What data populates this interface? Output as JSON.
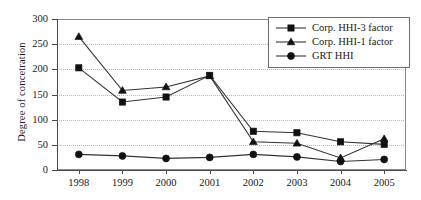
{
  "chart_data": {
    "type": "line",
    "title": "",
    "xlabel": "",
    "ylabel": "Degree of concetration",
    "categories": [
      "1998",
      "1999",
      "2000",
      "2001",
      "2002",
      "2003",
      "2004",
      "2005"
    ],
    "ylim": [
      0,
      300
    ],
    "yticks": [
      0,
      50,
      100,
      150,
      200,
      250,
      300
    ],
    "ytick_labels": [
      "0",
      "50",
      "100",
      "150",
      "200",
      "250",
      "300"
    ],
    "grid": true,
    "legend_position": "top-right",
    "series": [
      {
        "name": "Corp. HHI-3 factor",
        "marker": "square",
        "color": "#111111",
        "values": [
          203,
          135,
          145,
          188,
          77,
          74,
          56,
          51
        ]
      },
      {
        "name": "Corp. HHI-1 factor",
        "marker": "triangle",
        "color": "#111111",
        "values": [
          265,
          158,
          165,
          187,
          56,
          53,
          24,
          62
        ]
      },
      {
        "name": "GRT HHI",
        "marker": "circle",
        "color": "#111111",
        "values": [
          31,
          28,
          23,
          25,
          31,
          26,
          17,
          21
        ]
      }
    ]
  },
  "legend": {
    "items": [
      {
        "label": "Corp. HHI-3 factor",
        "marker": "square"
      },
      {
        "label": "Corp. HHI-1 factor",
        "marker": "triangle"
      },
      {
        "label": "GRT HHI",
        "marker": "circle"
      }
    ]
  }
}
